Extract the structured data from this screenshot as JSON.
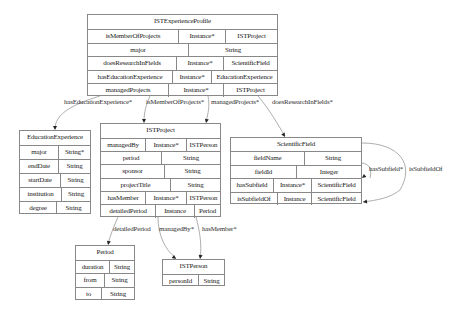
{
  "nodes": [
    {
      "id": "ISTExperienceProfile",
      "title": "ISTExperienceProfile",
      "box": {
        "x": 87,
        "y": 14,
        "w": 191,
        "h": 82
      },
      "rows": [
        [
          "isMemberOfProjects",
          "Instance*",
          "ISTProject"
        ],
        [
          "major",
          "String"
        ],
        [
          "doesResearchInFields",
          "Instance*",
          "ScientificField"
        ],
        [
          "hasEducationExperience",
          "Instance*",
          "EducationExperience"
        ],
        [
          "managedProjects",
          "Instance*",
          "ISTProject"
        ]
      ]
    },
    {
      "id": "EducationExperience",
      "title": "EducationExperience",
      "box": {
        "x": 19,
        "y": 130,
        "w": 72,
        "h": 84
      },
      "rows": [
        [
          "major",
          "String*"
        ],
        [
          "endDate",
          "String"
        ],
        [
          "startDate",
          "String"
        ],
        [
          "institution",
          "String"
        ],
        [
          "degree",
          "String"
        ]
      ]
    },
    {
      "id": "ISTProject",
      "title": "ISTProject",
      "box": {
        "x": 100,
        "y": 123,
        "w": 121,
        "h": 94
      },
      "rows": [
        [
          "managedBy",
          "Instance*",
          "ISTPerson"
        ],
        [
          "period",
          "String"
        ],
        [
          "sponsor",
          "String"
        ],
        [
          "projectTitle",
          "String"
        ],
        [
          "hasMember",
          "Instance*",
          "ISTPerson"
        ],
        [
          "detailedPeriod",
          "Instance",
          "Period"
        ]
      ]
    },
    {
      "id": "ScientificField",
      "title": "ScientificField",
      "box": {
        "x": 230,
        "y": 137,
        "w": 132,
        "h": 67
      },
      "rows": [
        [
          "fieldName",
          "String"
        ],
        [
          "fieldId",
          "Integer"
        ],
        [
          "hasSubfield",
          "Instance*",
          "ScientificField"
        ],
        [
          "isSubfieldOf",
          "Instance",
          "ScientificField"
        ]
      ]
    },
    {
      "id": "Period",
      "title": "Period",
      "box": {
        "x": 75,
        "y": 245,
        "w": 60,
        "h": 55
      },
      "rows": [
        [
          "duration",
          "String"
        ],
        [
          "from",
          "String"
        ],
        [
          "to",
          "String"
        ]
      ]
    },
    {
      "id": "ISTPerson",
      "title": "ISTPerson",
      "box": {
        "x": 162,
        "y": 259,
        "w": 63,
        "h": 27
      },
      "rows": [
        [
          "personId",
          "String"
        ]
      ]
    }
  ],
  "edges": [
    {
      "label": "hasEducationExperience*",
      "from": "ISTExperienceProfile",
      "to": "EducationExperience",
      "path": "M 100 96 C 70 105, 55 115, 55 129",
      "arrow": [
        55,
        130
      ],
      "label_pos": [
        63,
        102
      ]
    },
    {
      "label": "isMemberOfProjects*",
      "from": "ISTExperienceProfile",
      "to": "ISTProject",
      "path": "M 150 96 C 146 105, 144 112, 144 122",
      "arrow": [
        144,
        123
      ],
      "label_pos": [
        146,
        102
      ]
    },
    {
      "label": "managedProjects*",
      "from": "ISTExperienceProfile",
      "to": "ISTProject",
      "path": "M 208 96 C 210 106, 208 114, 206 122",
      "arrow": [
        206,
        123
      ],
      "label_pos": [
        211,
        102
      ]
    },
    {
      "label": "doesResearchInFields*",
      "from": "ISTExperienceProfile",
      "to": "ScientificField",
      "path": "M 258 96 C 270 110, 278 125, 285 136",
      "arrow": [
        285,
        137
      ],
      "label_pos": [
        272,
        102
      ]
    },
    {
      "label": "detailedPeriod",
      "from": "ISTProject",
      "to": "Period",
      "path": "M 118 217 C 114 226, 110 236, 108 244",
      "arrow": [
        108,
        245
      ],
      "label_pos": [
        113,
        229
      ]
    },
    {
      "label": "managedBy*",
      "from": "ISTProject",
      "to": "ISTPerson",
      "path": "M 158 217 C 158 235, 165 250, 176 258",
      "arrow": [
        176,
        259
      ],
      "label_pos": [
        160,
        229
      ]
    },
    {
      "label": "hasMember*",
      "from": "ISTProject",
      "to": "ISTPerson",
      "path": "M 196 217 C 200 232, 202 246, 200 258",
      "arrow": [
        200,
        259
      ],
      "label_pos": [
        202,
        229
      ]
    },
    {
      "label": "hasSubfield*",
      "from": "ScientificField",
      "to": "ScientificField",
      "path": "M 362 163 C 370 164, 372 170, 370 178",
      "arrow": [
        362,
        178
      ],
      "label_pos": [
        370,
        167
      ]
    },
    {
      "label": "isSubfieldOf",
      "from": "ScientificField",
      "to": "ScientificField",
      "path": "M 362 143 C 400 143, 415 165, 400 190 C 390 198, 378 200, 363 202",
      "arrow": [
        363,
        202
      ],
      "label_pos": [
        410,
        167
      ]
    }
  ],
  "colors": {
    "border": "#888888",
    "edge": "#999999",
    "arrow": "#222222",
    "text": "#222222"
  }
}
